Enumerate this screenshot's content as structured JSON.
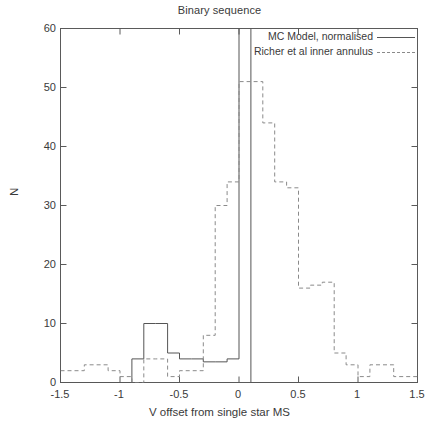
{
  "chart_data": {
    "type": "line",
    "plot_style": "step-histogram",
    "title": "Binary sequence",
    "xlabel": "V offset from single star MS",
    "ylabel": "N",
    "xlim": [
      -1.5,
      1.5
    ],
    "ylim": [
      0,
      60
    ],
    "xticks": [
      -1.5,
      -1,
      -0.5,
      0,
      0.5,
      1,
      1.5
    ],
    "xtick_labels": [
      "-1.5",
      "-1",
      "-0.5",
      "0",
      "0.5",
      "1",
      "1.5"
    ],
    "yticks": [
      0,
      10,
      20,
      30,
      40,
      50,
      60
    ],
    "ytick_labels": [
      "0",
      "10",
      "20",
      "30",
      "40",
      "50",
      "60"
    ],
    "grid": false,
    "legend_position": "top-right-inside",
    "bin_width": 0.1,
    "series": [
      {
        "name": "MC Model, normalised",
        "style": "solid",
        "color": "#555555",
        "bin_centers": [
          -1.45,
          -1.35,
          -1.25,
          -1.15,
          -1.05,
          -0.95,
          -0.85,
          -0.75,
          -0.65,
          -0.55,
          -0.45,
          -0.35,
          -0.25,
          -0.15,
          -0.05,
          0.05,
          0.15,
          0.25,
          0.35,
          0.45,
          0.55,
          0.65,
          0.75,
          0.85,
          0.95,
          1.05,
          1.15,
          1.25,
          1.35,
          1.45
        ],
        "values": [
          0,
          0,
          0,
          0,
          0,
          0,
          4,
          10,
          10,
          5,
          4,
          4,
          3.5,
          3.5,
          4,
          62,
          0,
          0,
          0,
          0,
          0,
          0,
          0,
          0,
          0,
          0,
          0,
          0,
          0,
          0
        ],
        "note": "Narrow spike at x=0 extends above the top of the plotted y-range"
      },
      {
        "name": "Richer et al inner annulus",
        "style": "dashed",
        "color": "#8a8a8a",
        "bin_centers": [
          -1.45,
          -1.35,
          -1.25,
          -1.15,
          -1.05,
          -0.95,
          -0.85,
          -0.75,
          -0.65,
          -0.55,
          -0.45,
          -0.35,
          -0.25,
          -0.15,
          -0.05,
          0.05,
          0.15,
          0.25,
          0.35,
          0.45,
          0.55,
          0.65,
          0.75,
          0.85,
          0.95,
          1.05,
          1.15,
          1.25,
          1.35,
          1.45
        ],
        "values": [
          2,
          2,
          3,
          3,
          2,
          1,
          0,
          4,
          4,
          1,
          2,
          2,
          8,
          30,
          34,
          51,
          51,
          44,
          34,
          33,
          16,
          16.5,
          17,
          5,
          3,
          1,
          3,
          3,
          1,
          1
        ]
      }
    ]
  },
  "chart": {
    "title": "Binary sequence",
    "xlabel": "V offset from single star MS",
    "ylabel": "N"
  },
  "legend": {
    "entries": [
      {
        "label": "MC Model, normalised",
        "style": "solid"
      },
      {
        "label": "Richer et al inner annulus",
        "style": "dashed"
      }
    ]
  }
}
